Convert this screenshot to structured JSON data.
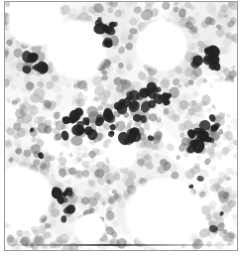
{
  "figure": {
    "kind": "histology-micrograph",
    "stain": "immunohistochemistry with hematoxylin counterstain",
    "alt_text": "Photomicrograph of a hypercellular bone marrow section showing densely packed hematopoietic cells with numerous dark-stained positive nuclei interspersed among pale round fat vacuoles.",
    "border_color": "#9a9a9a",
    "background_color": "#ffffff",
    "field_background": "#fbfbfb"
  },
  "palette": {
    "background": "#fbfbfb",
    "fat_vacuole": "#ffffff",
    "pale_cell": "#cfcfcf",
    "mid_cell": "#a8a8a8",
    "dark_cell": "#6e6e6e",
    "positive_nucleus": "#2b2b2b",
    "stroma_haze": "#e2e2e2",
    "scan_artifact": "#3c3c3c"
  },
  "field": {
    "width": 234,
    "height": 250,
    "cellularity_description": "hypercellular marrow",
    "counts": {
      "fat_vacuoles": 8,
      "stroma_blobs": 26,
      "pale_cells": 430,
      "mid_cells": 300,
      "dark_cells": 150,
      "positive_nuclei": 78
    }
  },
  "chart_data": {
    "type": "scatter",
    "xlabel": "",
    "ylabel": "",
    "xlim": [
      0,
      234
    ],
    "ylim": [
      0,
      250
    ],
    "grid": false,
    "legend": "none",
    "series": [
      {
        "name": "fat vacuoles",
        "color": "#ffffff",
        "marker": "ellipse",
        "points": [
          {
            "x": 30,
            "y": 18,
            "rx": 30,
            "ry": 22,
            "rot": -12,
            "blur": 5
          },
          {
            "x": 72,
            "y": 48,
            "rx": 32,
            "ry": 29,
            "rot": 14,
            "blur": 5
          },
          {
            "x": 158,
            "y": 44,
            "rx": 27,
            "ry": 24,
            "rot": -8,
            "blur": 5
          },
          {
            "x": 16,
            "y": 196,
            "rx": 33,
            "ry": 31,
            "rot": 6,
            "blur": 6
          },
          {
            "x": 160,
            "y": 214,
            "rx": 41,
            "ry": 30,
            "rot": -5,
            "blur": 6
          },
          {
            "x": 118,
            "y": 152,
            "rx": 17,
            "ry": 13,
            "rot": 20,
            "blur": 5
          },
          {
            "x": 224,
            "y": 96,
            "rx": 14,
            "ry": 18,
            "rot": 0,
            "blur": 5
          },
          {
            "x": 86,
            "y": 228,
            "rx": 16,
            "ry": 12,
            "rot": -18,
            "blur": 5
          }
        ]
      },
      {
        "name": "pale hematopoietic cells",
        "color": "#cfcfcf",
        "marker": "ellipse",
        "approx_radius": 3.2,
        "count": 430
      },
      {
        "name": "mid-tone nuclei",
        "color": "#a8a8a8",
        "marker": "ellipse",
        "approx_radius": 3.6,
        "count": 300
      },
      {
        "name": "dark nuclei",
        "color": "#6e6e6e",
        "marker": "ellipse",
        "approx_radius": 3.8,
        "count": 150
      },
      {
        "name": "immunopositive nuclei",
        "color": "#2b2b2b",
        "marker": "ellipse",
        "approx_radius": 4.2,
        "count": 78,
        "clusters": [
          {
            "x": 118,
            "y": 120,
            "spread": 34,
            "n": 16
          },
          {
            "x": 196,
            "y": 136,
            "spread": 30,
            "n": 14
          },
          {
            "x": 72,
            "y": 124,
            "spread": 28,
            "n": 11
          },
          {
            "x": 150,
            "y": 96,
            "spread": 26,
            "n": 10
          },
          {
            "x": 206,
            "y": 58,
            "spread": 24,
            "n": 8
          },
          {
            "x": 100,
            "y": 36,
            "spread": 22,
            "n": 7
          },
          {
            "x": 60,
            "y": 196,
            "spread": 24,
            "n": 6
          },
          {
            "x": 26,
            "y": 66,
            "spread": 22,
            "n": 6
          }
        ]
      }
    ]
  }
}
